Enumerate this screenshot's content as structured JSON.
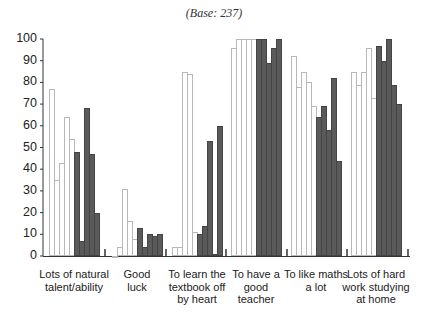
{
  "subtitle": "(Base: 237)",
  "chart_data": {
    "type": "bar",
    "title": "",
    "subtitle": "(Base: 237)",
    "xlabel": "",
    "ylabel": "",
    "ylim": [
      0,
      100
    ],
    "yticks": [
      0,
      10,
      20,
      30,
      40,
      50,
      60,
      70,
      80,
      90,
      100
    ],
    "grid": false,
    "legend": null,
    "bars_per_group": 10,
    "bar_style_note": "first 5 bars in each group are white/outlined, last 5 are dark grey",
    "categories": [
      "Lots of natural talent/ability",
      "Good luck",
      "To learn the textbook off by heart",
      "To have a good teacher",
      "To like maths a lot",
      "Lots of hard work studying at home"
    ],
    "category_lines": [
      [
        "Lots of natural",
        "talent/ability"
      ],
      [
        "Good",
        "luck"
      ],
      [
        "To learn the",
        "textbook off",
        "by heart"
      ],
      [
        "To have a",
        "good",
        "teacher"
      ],
      [
        "To like maths",
        "a lot"
      ],
      [
        "Lots of hard",
        "work studying",
        "at home"
      ]
    ],
    "groups": [
      {
        "category": "Lots of natural talent/ability",
        "values": [
          77,
          35,
          43,
          64,
          54,
          48,
          7,
          68,
          47,
          20
        ]
      },
      {
        "category": "Good luck",
        "values": [
          0,
          4,
          31,
          16,
          8,
          13,
          4,
          10,
          9,
          10
        ]
      },
      {
        "category": "To learn the textbook off by heart",
        "values": [
          4,
          4,
          85,
          84,
          11,
          10,
          14,
          53,
          1,
          60
        ]
      },
      {
        "category": "To have a good teacher",
        "values": [
          96,
          100,
          100,
          100,
          100,
          100,
          100,
          89,
          96,
          100
        ]
      },
      {
        "category": "To like maths a lot",
        "values": [
          92,
          78,
          85,
          80,
          69,
          64,
          69,
          58,
          82,
          44
        ]
      },
      {
        "category": "Lots of hard work studying at home",
        "values": [
          85,
          79,
          85,
          96,
          73,
          97,
          90,
          100,
          79,
          70
        ]
      }
    ]
  }
}
